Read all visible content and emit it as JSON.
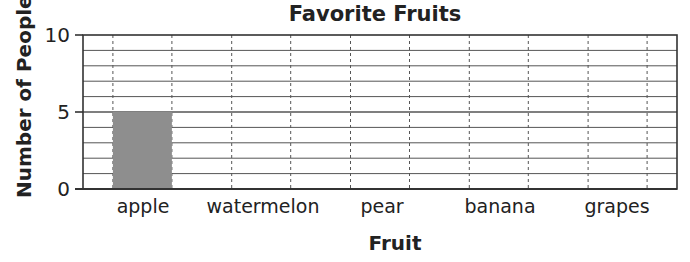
{
  "chart_data": {
    "type": "bar",
    "title": "Favorite Fruits",
    "xlabel": "Fruit",
    "ylabel": "Number of People",
    "categories": [
      "apple",
      "watermelon",
      "pear",
      "banana",
      "grapes"
    ],
    "values": [
      5,
      null,
      null,
      null,
      null
    ],
    "ylim": [
      0,
      10
    ],
    "yticks": [
      "0",
      "5",
      "10"
    ],
    "grid": true,
    "legend": null,
    "bar_color": "#8e8e8e"
  },
  "labels": {
    "title": "Favorite Fruits",
    "xlabel": "Fruit",
    "ylabel": "Number of People",
    "ytick_0": "0",
    "ytick_5": "5",
    "ytick_10": "10",
    "cat_0": "apple",
    "cat_1": "watermelon",
    "cat_2": "pear",
    "cat_3": "banana",
    "cat_4": "grapes"
  }
}
